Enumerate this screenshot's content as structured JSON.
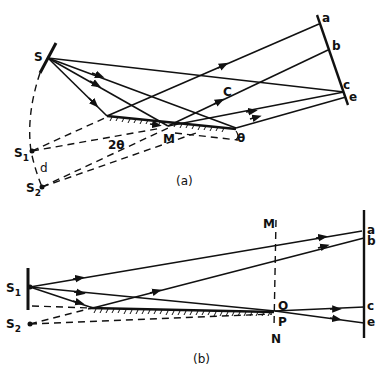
{
  "diagram": {
    "panel_a": {
      "caption": "(a)",
      "labels": {
        "source": "S",
        "image1": "S",
        "image1_sub": "1",
        "image2": "S",
        "image2_sub": "2",
        "separation": "d",
        "angle_double": "2θ",
        "angle": "θ",
        "mirror_point": "M",
        "ray_label": "C",
        "screen_a": "a",
        "screen_b": "b",
        "screen_c": "c",
        "screen_e": "e"
      }
    },
    "panel_b": {
      "caption": "(b)",
      "labels": {
        "source": "S",
        "source_sub": "1",
        "image": "S",
        "image_sub": "2",
        "line_top": "M",
        "line_bottom": "N",
        "point_o": "O",
        "point_p": "P",
        "screen_a": "a",
        "screen_b": "b",
        "screen_c": "c",
        "screen_e": "e"
      }
    }
  }
}
